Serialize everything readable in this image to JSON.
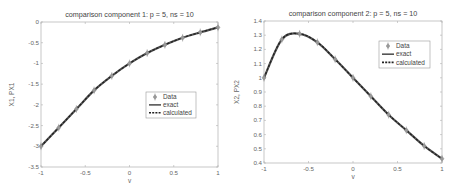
{
  "chart_data": [
    {
      "type": "line",
      "title": "comparison component 1: p = 5, ns = 10",
      "xlabel": "v",
      "ylabel": "X1, PX1",
      "xlim": [
        -1,
        1
      ],
      "ylim": [
        -3.5,
        0
      ],
      "xticks": [
        "-1",
        "-0.5",
        "0",
        "0.5",
        "1"
      ],
      "yticks": [
        "0",
        "-0.5",
        "-1",
        "-1.5",
        "-2",
        "-2.5",
        "-3",
        "-3.5"
      ],
      "grid": false,
      "legend_position": "center-right",
      "legend": [
        "Data",
        "exact",
        "calculated"
      ],
      "x": [
        -1,
        -0.8,
        -0.6,
        -0.4,
        -0.2,
        0,
        0.2,
        0.4,
        0.6,
        0.8,
        1
      ],
      "series": [
        {
          "name": "Data",
          "style": "diamond-markers",
          "values": [
            -3.0,
            -2.55,
            -2.1,
            -1.65,
            -1.3,
            -1.0,
            -0.75,
            -0.55,
            -0.38,
            -0.25,
            -0.13
          ]
        },
        {
          "name": "exact",
          "style": "solid",
          "values": [
            -3.0,
            -2.55,
            -2.1,
            -1.65,
            -1.3,
            -1.0,
            -0.75,
            -0.55,
            -0.38,
            -0.25,
            -0.13
          ]
        },
        {
          "name": "calculated",
          "style": "dashed",
          "values": [
            -3.0,
            -2.55,
            -2.1,
            -1.65,
            -1.3,
            -1.0,
            -0.75,
            -0.55,
            -0.38,
            -0.25,
            -0.13
          ]
        }
      ]
    },
    {
      "type": "line",
      "title": "comparison component 2: p = 5, ns = 10",
      "xlabel": "v",
      "ylabel": "X2, PX2",
      "xlim": [
        -1,
        1
      ],
      "ylim": [
        0.4,
        1.4
      ],
      "xticks": [
        "-1",
        "-0.5",
        "0",
        "0.5",
        "1"
      ],
      "yticks": [
        "1.4",
        "1.3",
        "1.2",
        "1.1",
        "1",
        "0.9",
        "0.8",
        "0.7",
        "0.6",
        "0.5",
        "0.4"
      ],
      "grid": false,
      "legend_position": "upper-right",
      "legend": [
        "Data",
        "exact",
        "calculated"
      ],
      "x": [
        -1,
        -0.8,
        -0.6,
        -0.4,
        -0.2,
        0,
        0.2,
        0.4,
        0.6,
        0.8,
        1
      ],
      "series": [
        {
          "name": "Data",
          "style": "diamond-markers",
          "values": [
            1.0,
            1.27,
            1.31,
            1.25,
            1.13,
            1.0,
            0.87,
            0.74,
            0.63,
            0.52,
            0.43
          ]
        },
        {
          "name": "exact",
          "style": "solid",
          "values": [
            1.0,
            1.27,
            1.31,
            1.25,
            1.13,
            1.0,
            0.87,
            0.74,
            0.63,
            0.52,
            0.43
          ]
        },
        {
          "name": "calculated",
          "style": "dashed",
          "values": [
            1.0,
            1.27,
            1.31,
            1.25,
            1.13,
            1.0,
            0.87,
            0.74,
            0.63,
            0.52,
            0.43
          ]
        }
      ]
    }
  ],
  "colors": {
    "axis": "#b0b0b0",
    "exact_line": "#555555",
    "calculated_line": "#222222",
    "marker_fill": "#9a9a9a",
    "text": "#555555"
  }
}
